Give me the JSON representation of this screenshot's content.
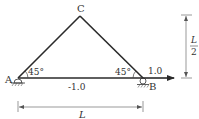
{
  "diagram": {
    "type": "truss",
    "nodes": {
      "A": {
        "label": "A",
        "support": "pin"
      },
      "B": {
        "label": "B",
        "support": "roller"
      },
      "C": {
        "label": "C"
      }
    },
    "members": [
      {
        "from": "A",
        "to": "C"
      },
      {
        "from": "C",
        "to": "B"
      },
      {
        "from": "A",
        "to": "B",
        "force_label": "-1.0"
      }
    ],
    "angles": {
      "at_A": "45°",
      "at_B": "45°"
    },
    "load": {
      "at": "B",
      "direction": "right",
      "label": "1.0"
    },
    "dimensions": {
      "horizontal": {
        "label": "L"
      },
      "vertical": {
        "numerator": "L",
        "denominator": "2"
      }
    },
    "colors": {
      "member": "#2a2a2a",
      "text": "#333333",
      "dimension": "#555555"
    }
  }
}
